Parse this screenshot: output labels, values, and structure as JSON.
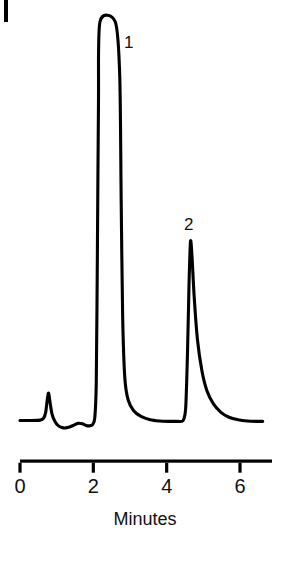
{
  "figure": {
    "background_color": "#ffffff",
    "trace_color": "#000000",
    "axis_color": "#000000"
  },
  "chart_data": {
    "type": "line",
    "title": "",
    "subtitle": "",
    "xlabel": "Minutes",
    "ylabel": "",
    "xlim": [
      -0.05,
      7.0
    ],
    "ylim": [
      0,
      1.0
    ],
    "grid": false,
    "legend": false,
    "legend_position": "none",
    "x_ticks": [
      0,
      2,
      4,
      6
    ],
    "x_tick_labels": [
      "0",
      "2",
      "4",
      "6"
    ],
    "y_ticks": [],
    "y_tick_labels": [],
    "y_axis_visible": false,
    "y_axis_stub_visible": true,
    "annotations": [
      {
        "text": "1",
        "x": 2.95,
        "y": 0.93,
        "peak_index": 0
      },
      {
        "text": "2",
        "x": 4.62,
        "y": 0.545,
        "peak_index": 1
      }
    ],
    "peaks": [
      {
        "label": "",
        "retention_time": 0.78,
        "height_normalized": 0.095,
        "shape": "sharp-narrow",
        "clipped": false,
        "note": "unlabeled early solvent/void peak"
      },
      {
        "label": "1",
        "retention_time": 2.35,
        "height_normalized": 1.0,
        "shape": "flat-topped",
        "clipped": true,
        "note": "detector saturated, plateau at full scale"
      },
      {
        "label": "2",
        "retention_time": 4.67,
        "height_normalized": 0.465,
        "shape": "tailing",
        "clipped": false,
        "note": "asymmetric with pronounced tail"
      }
    ],
    "series": [
      {
        "name": "detector-response",
        "x": [
          0.0,
          0.3,
          0.55,
          0.64,
          0.7,
          0.745,
          0.78,
          0.82,
          0.87,
          0.95,
          1.05,
          1.18,
          1.3,
          1.45,
          1.58,
          1.7,
          1.8,
          1.9,
          1.98,
          2.04,
          2.08,
          2.11,
          2.14,
          2.18,
          2.6,
          2.72,
          2.76,
          2.8,
          2.86,
          2.95,
          3.1,
          3.3,
          3.55,
          3.8,
          4.05,
          4.3,
          4.45,
          4.52,
          4.57,
          4.61,
          4.65,
          4.69,
          4.75,
          4.84,
          4.96,
          5.1,
          5.28,
          5.48,
          5.7,
          5.95,
          6.2,
          6.45,
          6.62
        ],
        "y": [
          0.028,
          0.028,
          0.029,
          0.033,
          0.048,
          0.08,
          0.095,
          0.072,
          0.045,
          0.026,
          0.015,
          0.01,
          0.011,
          0.016,
          0.021,
          0.02,
          0.016,
          0.015,
          0.018,
          0.035,
          0.12,
          0.43,
          0.8,
          1.0,
          1.0,
          0.87,
          0.56,
          0.28,
          0.13,
          0.078,
          0.052,
          0.038,
          0.03,
          0.027,
          0.026,
          0.026,
          0.028,
          0.06,
          0.2,
          0.36,
          0.465,
          0.43,
          0.33,
          0.225,
          0.15,
          0.1,
          0.068,
          0.048,
          0.036,
          0.03,
          0.027,
          0.026,
          0.026
        ]
      }
    ]
  }
}
